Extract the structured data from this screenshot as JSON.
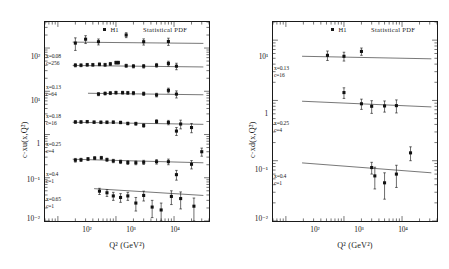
{
  "figure": {
    "panels": [
      {
        "id": "left",
        "legend": {
          "marker_label": "H1",
          "curve_label": "Statistical PDF"
        },
        "axes": {
          "xlabel": "Q² (GeV²)",
          "ylabel": "c·xu(x,Q²)",
          "xticks": [
            "10²",
            "10³",
            "10⁴"
          ],
          "yticks": [
            "10²",
            "10¹",
            "1",
            "10⁻¹",
            "10⁻²"
          ]
        },
        "bins": [
          {
            "x_label": "x=0.08",
            "c_label": "c=256"
          },
          {
            "x_label": "x=0.13",
            "c_label": "c=64"
          },
          {
            "x_label": "x=0.18",
            "c_label": "c=16"
          },
          {
            "x_label": "x=0.25",
            "c_label": "c=4"
          },
          {
            "x_label": "x=0.4",
            "c_label": "c=1"
          },
          {
            "x_label": "x=0.65",
            "c_label": "c=1"
          }
        ]
      },
      {
        "id": "right",
        "legend": {
          "marker_label": "H1",
          "curve_label": "Statistical PDF"
        },
        "axes": {
          "xlabel": "Q² (GeV²)",
          "ylabel": "c·xd(x,Q²)",
          "xticks": [
            "10²",
            "10³",
            "10⁴"
          ],
          "yticks": [
            "10¹",
            "1",
            "10⁻¹",
            "10⁻²"
          ]
        },
        "bins": [
          {
            "x_label": "x=0.13",
            "c_label": "c=16"
          },
          {
            "x_label": "x=0.25",
            "c_label": "c=4"
          },
          {
            "x_label": "x=0.4",
            "c_label": "c=1"
          }
        ]
      }
    ]
  },
  "chart_data": [
    {
      "type": "scatter",
      "title": "",
      "xlabel": "Q² (GeV²)",
      "ylabel": "c·xu(x,Q²)",
      "xscale": "log",
      "yscale": "log",
      "xlim": [
        60,
        40000
      ],
      "ylim": [
        0.01,
        400
      ],
      "grid": false,
      "legend": [
        "H1",
        "Statistical PDF"
      ],
      "legend_position": "top-center",
      "marker": "filled-square",
      "errorbars": "vertical",
      "series": [
        {
          "name": "x=0.08, c=256",
          "scale_factor": 256,
          "x_bin": 0.08,
          "points": [
            {
              "x": 200,
              "y": 130,
              "yerr": 42
            },
            {
              "x": 300,
              "y": 160,
              "yerr": 33
            },
            {
              "x": 500,
              "y": 140,
              "yerr": 22
            },
            {
              "x": 1500,
              "y": 200,
              "yerr": 26
            },
            {
              "x": 3000,
              "y": 140,
              "yerr": 23
            },
            {
              "x": 8000,
              "y": 142,
              "yerr": 27
            }
          ],
          "fit": [
            {
              "x": 180,
              "y": 137
            },
            {
              "x": 32000,
              "y": 128
            }
          ]
        },
        {
          "name": "x=0.13, c=64",
          "scale_factor": 64,
          "x_bin": 0.13,
          "points": [
            {
              "x": 200,
              "y": 40,
              "yerr": 3.4
            },
            {
              "x": 250,
              "y": 40,
              "yerr": 3.0
            },
            {
              "x": 320,
              "y": 41,
              "yerr": 3.0
            },
            {
              "x": 400,
              "y": 41,
              "yerr": 3.0
            },
            {
              "x": 520,
              "y": 42,
              "yerr": 3.2
            },
            {
              "x": 650,
              "y": 41,
              "yerr": 3.2
            },
            {
              "x": 800,
              "y": 43,
              "yerr": 3.4
            },
            {
              "x": 1000,
              "y": 46,
              "yerr": 3.6
            },
            {
              "x": 1100,
              "y": 46,
              "yerr": 3.6
            },
            {
              "x": 1500,
              "y": 39,
              "yerr": 3.2
            },
            {
              "x": 2000,
              "y": 38,
              "yerr": 3.4
            },
            {
              "x": 3000,
              "y": 38,
              "yerr": 3.6
            },
            {
              "x": 5000,
              "y": 40,
              "yerr": 4.0
            },
            {
              "x": 8000,
              "y": 44,
              "yerr": 5.5
            },
            {
              "x": 11000,
              "y": 38,
              "yerr": 6.5
            }
          ],
          "fit": [
            {
              "x": 180,
              "y": 39.5
            },
            {
              "x": 32000,
              "y": 36.5
            }
          ]
        },
        {
          "name": "x=0.18, c=16",
          "scale_factor": 16,
          "x_bin": 0.18,
          "points": [
            {
              "x": 500,
              "y": 8.6,
              "yerr": 0.7
            },
            {
              "x": 650,
              "y": 8.9,
              "yerr": 0.7
            },
            {
              "x": 800,
              "y": 9.1,
              "yerr": 0.7
            },
            {
              "x": 1000,
              "y": 9.3,
              "yerr": 0.7
            },
            {
              "x": 1300,
              "y": 9.3,
              "yerr": 0.7
            },
            {
              "x": 1600,
              "y": 9.2,
              "yerr": 0.7
            },
            {
              "x": 2000,
              "y": 9.1,
              "yerr": 0.8
            },
            {
              "x": 3000,
              "y": 8.8,
              "yerr": 0.8
            },
            {
              "x": 5000,
              "y": 8.2,
              "yerr": 0.8
            },
            {
              "x": 8000,
              "y": 10.5,
              "yerr": 1.3
            },
            {
              "x": 11000,
              "y": 8.6,
              "yerr": 1.6
            }
          ],
          "fit": [
            {
              "x": 330,
              "y": 9.0
            },
            {
              "x": 32000,
              "y": 8.3
            }
          ]
        },
        {
          "name": "x=0.25, c=4",
          "scale_factor": 4,
          "x_bin": 0.25,
          "points": [
            {
              "x": 200,
              "y": 1.95,
              "yerr": 0.14
            },
            {
              "x": 250,
              "y": 1.95,
              "yerr": 0.13
            },
            {
              "x": 320,
              "y": 1.98,
              "yerr": 0.13
            },
            {
              "x": 420,
              "y": 1.93,
              "yerr": 0.13
            },
            {
              "x": 550,
              "y": 1.92,
              "yerr": 0.13
            },
            {
              "x": 700,
              "y": 1.92,
              "yerr": 0.13
            },
            {
              "x": 900,
              "y": 1.93,
              "yerr": 0.13
            },
            {
              "x": 1200,
              "y": 1.9,
              "yerr": 0.13
            },
            {
              "x": 1600,
              "y": 1.8,
              "yerr": 0.13
            },
            {
              "x": 2200,
              "y": 1.78,
              "yerr": 0.14
            },
            {
              "x": 3000,
              "y": 1.62,
              "yerr": 0.15
            },
            {
              "x": 5000,
              "y": 2.0,
              "yerr": 0.2
            },
            {
              "x": 8000,
              "y": 1.9,
              "yerr": 0.22
            },
            {
              "x": 11000,
              "y": 1.2,
              "yerr": 0.25
            },
            {
              "x": 13000,
              "y": 1.75,
              "yerr": 0.4
            },
            {
              "x": 20000,
              "y": 1.45,
              "yerr": 0.35
            }
          ],
          "fit": [
            {
              "x": 180,
              "y": 1.92
            },
            {
              "x": 32000,
              "y": 1.72
            }
          ]
        },
        {
          "name": "x=0.4, c=1",
          "scale_factor": 1,
          "x_bin": 0.4,
          "points": [
            {
              "x": 200,
              "y": 0.255,
              "yerr": 0.025
            },
            {
              "x": 250,
              "y": 0.26,
              "yerr": 0.022
            },
            {
              "x": 330,
              "y": 0.272,
              "yerr": 0.022
            },
            {
              "x": 430,
              "y": 0.285,
              "yerr": 0.022
            },
            {
              "x": 560,
              "y": 0.29,
              "yerr": 0.022
            },
            {
              "x": 700,
              "y": 0.262,
              "yerr": 0.022
            },
            {
              "x": 900,
              "y": 0.245,
              "yerr": 0.022
            },
            {
              "x": 1200,
              "y": 0.235,
              "yerr": 0.022
            },
            {
              "x": 1600,
              "y": 0.225,
              "yerr": 0.022
            },
            {
              "x": 2200,
              "y": 0.222,
              "yerr": 0.022
            },
            {
              "x": 3000,
              "y": 0.228,
              "yerr": 0.025
            },
            {
              "x": 5000,
              "y": 0.235,
              "yerr": 0.028
            },
            {
              "x": 8000,
              "y": 0.235,
              "yerr": 0.035
            },
            {
              "x": 11000,
              "y": 0.118,
              "yerr": 0.03
            },
            {
              "x": 20000,
              "y": 0.205,
              "yerr": 0.045
            },
            {
              "x": 30000,
              "y": 0.4,
              "yerr": 0.085
            }
          ],
          "fit": [
            {
              "x": 180,
              "y": 0.268
            },
            {
              "x": 32000,
              "y": 0.222
            }
          ]
        },
        {
          "name": "x=0.65, c=1",
          "scale_factor": 1,
          "x_bin": 0.65,
          "points": [
            {
              "x": 520,
              "y": 0.049,
              "yerr": 0.008
            },
            {
              "x": 700,
              "y": 0.045,
              "yerr": 0.008
            },
            {
              "x": 900,
              "y": 0.038,
              "yerr": 0.008
            },
            {
              "x": 1200,
              "y": 0.035,
              "yerr": 0.008
            },
            {
              "x": 1600,
              "y": 0.038,
              "yerr": 0.008
            },
            {
              "x": 2200,
              "y": 0.026,
              "yerr": 0.009
            },
            {
              "x": 3000,
              "y": 0.039,
              "yerr": 0.01
            },
            {
              "x": 4200,
              "y": 0.021,
              "yerr": 0.009
            },
            {
              "x": 6000,
              "y": 0.018,
              "yerr": 0.008
            },
            {
              "x": 9000,
              "y": 0.037,
              "yerr": 0.013
            },
            {
              "x": 13000,
              "y": 0.033,
              "yerr": 0.014
            },
            {
              "x": 22000,
              "y": 0.022,
              "yerr": 0.012
            }
          ],
          "fit": [
            {
              "x": 420,
              "y": 0.056
            },
            {
              "x": 32000,
              "y": 0.039
            }
          ]
        }
      ]
    },
    {
      "type": "scatter",
      "title": "",
      "xlabel": "Q² (GeV²)",
      "ylabel": "c·xd(x,Q²)",
      "xscale": "log",
      "yscale": "log",
      "xlim": [
        60,
        40000
      ],
      "ylim": [
        0.01,
        20
      ],
      "grid": false,
      "legend": [
        "H1",
        "Statistical PDF"
      ],
      "legend_position": "top-center",
      "marker": "filled-square",
      "errorbars": "vertical",
      "series": [
        {
          "name": "x=0.13, c=16",
          "scale_factor": 16,
          "x_bin": 0.13,
          "points": [
            {
              "x": 520,
              "y": 5.6,
              "yerr": 1.0
            },
            {
              "x": 1000,
              "y": 5.4,
              "yerr": 0.9
            },
            {
              "x": 2000,
              "y": 6.5,
              "yerr": 0.9
            }
          ],
          "fit": [
            {
              "x": 190,
              "y": 5.4
            },
            {
              "x": 32000,
              "y": 4.9
            }
          ]
        },
        {
          "name": "x=0.25, c=4",
          "scale_factor": 4,
          "x_bin": 0.25,
          "points": [
            {
              "x": 1000,
              "y": 1.35,
              "yerr": 0.27
            },
            {
              "x": 2000,
              "y": 0.88,
              "yerr": 0.17
            },
            {
              "x": 3000,
              "y": 0.8,
              "yerr": 0.19
            },
            {
              "x": 5000,
              "y": 0.81,
              "yerr": 0.17
            },
            {
              "x": 8000,
              "y": 0.82,
              "yerr": 0.2
            }
          ],
          "fit": [
            {
              "x": 190,
              "y": 0.97
            },
            {
              "x": 32000,
              "y": 0.78
            }
          ]
        },
        {
          "name": "x=0.4, c=1",
          "scale_factor": 1,
          "x_bin": 0.4,
          "points": [
            {
              "x": 3000,
              "y": 0.077,
              "yerr": 0.017
            },
            {
              "x": 3400,
              "y": 0.056,
              "yerr": 0.022
            },
            {
              "x": 5000,
              "y": 0.043,
              "yerr": 0.02
            },
            {
              "x": 8000,
              "y": 0.06,
              "yerr": 0.024
            },
            {
              "x": 14000,
              "y": 0.135,
              "yerr": 0.035
            }
          ],
          "fit": [
            {
              "x": 190,
              "y": 0.092
            },
            {
              "x": 32000,
              "y": 0.063
            }
          ]
        }
      ]
    }
  ]
}
